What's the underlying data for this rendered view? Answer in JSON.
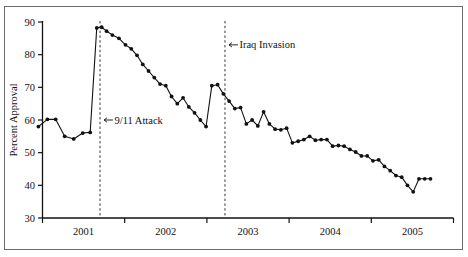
{
  "chart_data": {
    "type": "line",
    "title": "",
    "subtitle": "",
    "xlabel": "",
    "ylabel": "Percent Approval",
    "ylim": [
      30,
      90
    ],
    "xlim": [
      2000.75,
      2005.85
    ],
    "yticks": [
      30,
      40,
      50,
      60,
      70,
      80,
      90
    ],
    "ytick_labels": [
      "30",
      "40",
      "50",
      "60",
      "70",
      "80",
      "90"
    ],
    "xticks": [
      2001,
      2002,
      2003,
      2004,
      2005,
      2006
    ],
    "xtick_labels": [
      "2001",
      "2002",
      "2003",
      "2004",
      "2005"
    ],
    "xtick_label_positions": [
      2001.5,
      2002.5,
      2003.5,
      2004.5,
      2005.5
    ],
    "grid": false,
    "legend": null,
    "legend_position": "none",
    "markers": "filled-circle",
    "annotations": [
      {
        "label": "9/11 Attack",
        "x": 2001.7,
        "y": 60.0,
        "line_x": 2001.7,
        "arrow": "left",
        "style": "dashed-vertical-line"
      },
      {
        "label": "Iraq Invasion",
        "x": 2003.22,
        "y": 83.0,
        "line_x": 2003.22,
        "arrow": "left",
        "style": "dashed-vertical-line"
      }
    ],
    "series": [
      {
        "name": "Presidential Approval",
        "x": [
          2000.95,
          2001.06,
          2001.16,
          2001.27,
          2001.38,
          2001.49,
          2001.58,
          2001.66,
          2001.72,
          2001.78,
          2001.85,
          2001.93,
          2002.01,
          2002.08,
          2002.15,
          2002.22,
          2002.29,
          2002.36,
          2002.43,
          2002.5,
          2002.57,
          2002.64,
          2002.71,
          2002.78,
          2002.85,
          2002.92,
          2002.99,
          2003.06,
          2003.13,
          2003.2,
          2003.27,
          2003.34,
          2003.41,
          2003.48,
          2003.55,
          2003.62,
          2003.69,
          2003.76,
          2003.83,
          2003.9,
          2003.97,
          2004.04,
          2004.11,
          2004.18,
          2004.25,
          2004.32,
          2004.39,
          2004.46,
          2004.53,
          2004.6,
          2004.67,
          2004.74,
          2004.81,
          2004.88,
          2004.95,
          2005.02,
          2005.09,
          2005.16,
          2005.23,
          2005.3,
          2005.37,
          2005.44,
          2005.51,
          2005.58,
          2005.65,
          2005.72
        ],
        "values": [
          58.0,
          60.2,
          60.2,
          55.0,
          54.2,
          56.0,
          56.2,
          88.2,
          88.4,
          87.2,
          86.0,
          85.0,
          83.0,
          81.8,
          79.8,
          77.0,
          75.0,
          73.0,
          71.0,
          70.5,
          67.2,
          65.0,
          66.8,
          64.0,
          62.2,
          60.0,
          58.0,
          70.5,
          70.8,
          68.0,
          65.8,
          63.5,
          63.8,
          58.8,
          60.0,
          58.2,
          62.5,
          58.8,
          57.2,
          57.0,
          57.5,
          53.0,
          53.5,
          54.0,
          55.0,
          53.8,
          54.0,
          54.0,
          52.0,
          52.2,
          52.0,
          51.0,
          50.2,
          49.0,
          49.0,
          47.5,
          47.8,
          45.8,
          44.5,
          43.0,
          42.5,
          40.0,
          38.0,
          42.0,
          42.0,
          42.0
        ]
      }
    ]
  },
  "frame": {
    "border_color": "#6c6c6c",
    "background": "#ffffff",
    "ink_color": "#111111"
  }
}
